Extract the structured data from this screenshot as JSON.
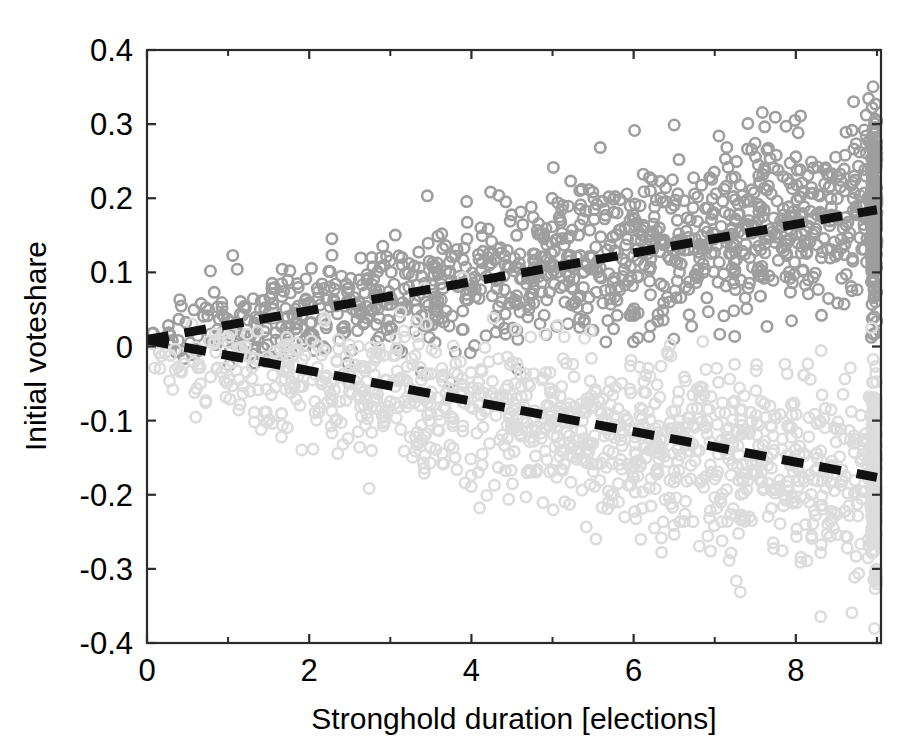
{
  "figure": {
    "title": "",
    "background_color": "#ffffff"
  },
  "axes": {
    "x_label": "Stronghold duration [elections]",
    "y_label": "Initial voteshare",
    "x_ticks": [
      "0",
      "2",
      "4",
      "6",
      "8"
    ],
    "y_ticks": [
      "0.4",
      "0.3",
      "0.2",
      "0.1",
      "0",
      "-0.1",
      "-0.2",
      "-0.3",
      "-0.4"
    ]
  },
  "chart_data": {
    "type": "scatter",
    "title": "",
    "xlabel": "Stronghold duration [elections]",
    "ylabel": "Initial voteshare",
    "xlim": [
      0,
      9.05
    ],
    "ylim": [
      -0.4,
      0.4
    ],
    "xticks": [
      0,
      2,
      4,
      6,
      8
    ],
    "xticks_minor": [
      1,
      3,
      5,
      7,
      9
    ],
    "yticks": [
      -0.4,
      -0.3,
      -0.2,
      -0.1,
      0,
      0.1,
      0.2,
      0.3,
      0.4
    ],
    "grid": false,
    "legend": null,
    "marker": "open-circle",
    "marker_size": 9,
    "colors": {
      "winner_points": "#9e9e9e",
      "loser_points": "#dcdcdc",
      "fit_line": "#111111",
      "axis": "#2b2b2b"
    },
    "series": [
      {
        "name": "Winning party strongholds",
        "color": "#9e9e9e",
        "n_points": 1400,
        "description": "Upper cloud of darker grey open circles; initial voteshare rises with stronghold duration",
        "trend": {
          "slope": 0.0194,
          "intercept": 0.0095,
          "x_start": 0.0,
          "x_end": 9.0,
          "y_start": 0.0095,
          "y_end": 0.1845
        },
        "scatter_envelope": [
          {
            "x": 0,
            "y_mean": 0.012,
            "y_sd": 0.022
          },
          {
            "x": 1,
            "y_mean": 0.033,
            "y_sd": 0.03
          },
          {
            "x": 2,
            "y_mean": 0.05,
            "y_sd": 0.034
          },
          {
            "x": 3,
            "y_mean": 0.068,
            "y_sd": 0.04
          },
          {
            "x": 4,
            "y_mean": 0.087,
            "y_sd": 0.044
          },
          {
            "x": 5,
            "y_mean": 0.106,
            "y_sd": 0.048
          },
          {
            "x": 6,
            "y_mean": 0.126,
            "y_sd": 0.052
          },
          {
            "x": 7,
            "y_mean": 0.146,
            "y_sd": 0.057
          },
          {
            "x": 8,
            "y_mean": 0.165,
            "y_sd": 0.06
          },
          {
            "x": 9,
            "y_mean": 0.186,
            "y_sd": 0.063
          }
        ]
      },
      {
        "name": "Losing party strongholds",
        "color": "#dcdcdc",
        "n_points": 1400,
        "description": "Lower cloud of lighter grey open circles; initial voteshare falls with stronghold duration",
        "trend": {
          "slope": -0.0206,
          "intercept": 0.0085,
          "x_start": 0.0,
          "x_end": 9.0,
          "y_start": 0.0085,
          "y_end": -0.1765
        },
        "scatter_envelope": [
          {
            "x": 0,
            "y_mean": -0.01,
            "y_sd": 0.024
          },
          {
            "x": 1,
            "y_mean": -0.03,
            "y_sd": 0.034
          },
          {
            "x": 2,
            "y_mean": -0.05,
            "y_sd": 0.042
          },
          {
            "x": 3,
            "y_mean": -0.068,
            "y_sd": 0.048
          },
          {
            "x": 4,
            "y_mean": -0.088,
            "y_sd": 0.053
          },
          {
            "x": 5,
            "y_mean": -0.107,
            "y_sd": 0.057
          },
          {
            "x": 6,
            "y_mean": -0.126,
            "y_sd": 0.06
          },
          {
            "x": 7,
            "y_mean": -0.145,
            "y_sd": 0.062
          },
          {
            "x": 8,
            "y_mean": -0.163,
            "y_sd": 0.064
          },
          {
            "x": 9,
            "y_mean": -0.182,
            "y_sd": 0.066
          }
        ]
      }
    ],
    "fit_lines": [
      {
        "name": "upper-fit",
        "style": "dashed",
        "color": "#111111",
        "points": [
          [
            0.0,
            0.0095
          ],
          [
            9.0,
            0.1845
          ]
        ]
      },
      {
        "name": "lower-fit",
        "style": "dashed",
        "color": "#111111",
        "points": [
          [
            0.0,
            0.0085
          ],
          [
            9.0,
            -0.1765
          ]
        ]
      }
    ]
  }
}
